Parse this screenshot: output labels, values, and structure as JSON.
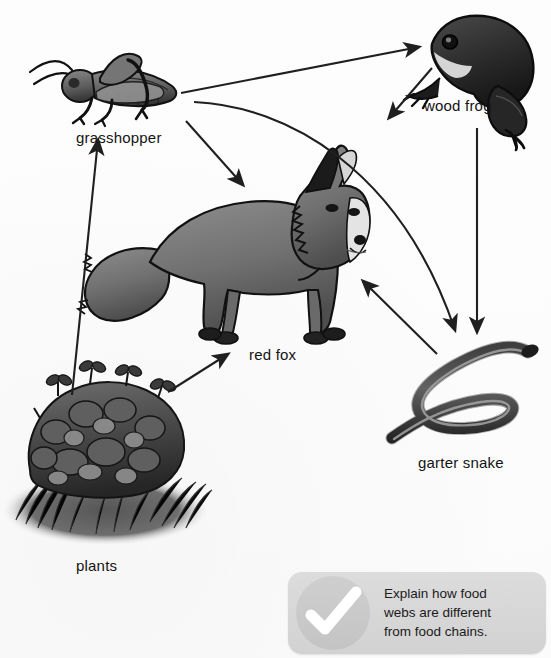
{
  "diagram": {
    "title": "Food web",
    "background_color": "#fcfcfc",
    "line_color": "#1f1f1f",
    "organisms": [
      {
        "id": "grasshopper",
        "label": "grasshopper",
        "role": "primary-consumer",
        "label_x": 76,
        "label_y": 130,
        "art_cx": 105,
        "art_cy": 90
      },
      {
        "id": "wood-frog",
        "label": "wood frog",
        "role": "secondary-consumer",
        "label_x": 424,
        "label_y": 98,
        "art_cx": 480,
        "art_cy": 60
      },
      {
        "id": "red-fox",
        "label": "red fox",
        "role": "tertiary-consumer",
        "label_x": 249,
        "label_y": 347,
        "art_cx": 260,
        "art_cy": 250
      },
      {
        "id": "garter-snake",
        "label": "garter snake",
        "role": "secondary-consumer",
        "label_x": 418,
        "label_y": 455,
        "art_cx": 470,
        "art_cy": 405
      },
      {
        "id": "plants",
        "label": "plants",
        "role": "producer",
        "label_x": 76,
        "label_y": 558,
        "art_cx": 100,
        "art_cy": 455
      }
    ],
    "arrows": [
      {
        "id": "plants-to-grasshopper",
        "from": "plants",
        "to": "grasshopper",
        "shape": "straight"
      },
      {
        "id": "plants-to-red-fox",
        "from": "plants",
        "to": "red-fox",
        "shape": "straight"
      },
      {
        "id": "grasshopper-to-wood-frog",
        "from": "grasshopper",
        "to": "wood-frog",
        "shape": "straight"
      },
      {
        "id": "grasshopper-to-red-fox",
        "from": "grasshopper",
        "to": "red-fox",
        "shape": "straight"
      },
      {
        "id": "grasshopper-to-garter-snake",
        "from": "grasshopper",
        "to": "garter-snake",
        "shape": "curved"
      },
      {
        "id": "wood-frog-to-red-fox",
        "from": "wood-frog",
        "to": "red-fox",
        "shape": "straight"
      },
      {
        "id": "wood-frog-to-garter-snake",
        "from": "wood-frog",
        "to": "garter-snake",
        "shape": "straight"
      },
      {
        "id": "garter-snake-to-red-fox",
        "from": "garter-snake",
        "to": "red-fox",
        "shape": "straight"
      }
    ]
  },
  "callout": {
    "icon": "check-icon",
    "background_color": "#d9d9d9",
    "lines": [
      "Explain how food",
      "webs are different",
      "from food chains."
    ]
  }
}
